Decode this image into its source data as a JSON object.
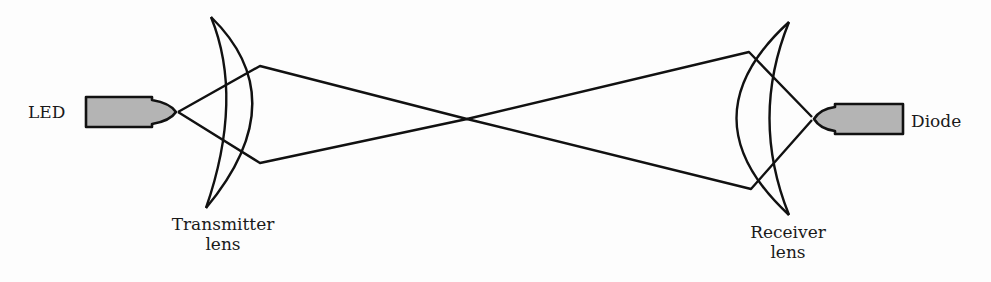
{
  "diagram": {
    "colors": {
      "stroke": "#111111",
      "component_fill": "#b4b4b4",
      "background": "#fdfdfd"
    },
    "components": {
      "led": {
        "label": "LED"
      },
      "transmitter_lens": {
        "label_line1": "Transmitter",
        "label_line2": "lens"
      },
      "receiver_lens": {
        "label_line1": "Receiver",
        "label_line2": "lens"
      },
      "diode": {
        "label": "Diode"
      }
    },
    "rays": [
      {
        "from": "LED tip",
        "to": "Transmitter lens top",
        "then": "crosses center",
        "end": "Receiver lens bottom"
      },
      {
        "from": "LED tip",
        "to": "Transmitter lens bottom",
        "then": "crosses center",
        "end": "Receiver lens top"
      }
    ]
  }
}
